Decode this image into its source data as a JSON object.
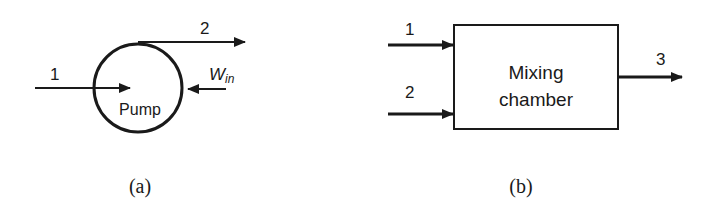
{
  "panel_a": {
    "caption": "(a)",
    "device_label": "Pump",
    "inlet_label": "1",
    "outlet_label": "2",
    "work_label_main": "W",
    "work_label_sub": "in"
  },
  "panel_b": {
    "caption": "(b)",
    "device_label_line1": "Mixing",
    "device_label_line2": "chamber",
    "inlet1_label": "1",
    "inlet2_label": "2",
    "outlet_label": "3"
  },
  "colors": {
    "stroke": "#1a1a1a",
    "background": "#ffffff"
  }
}
